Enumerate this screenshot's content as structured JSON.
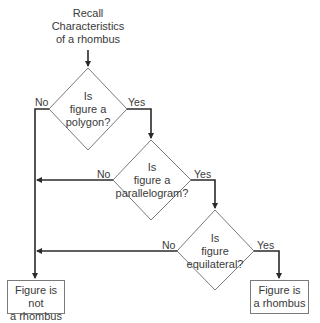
{
  "start": {
    "lines": [
      "Recall",
      "Characteristics",
      "of a rhombus"
    ]
  },
  "decisions": [
    {
      "lines": [
        "Is",
        "figure a",
        "polygon?"
      ],
      "no": "No",
      "yes": "Yes"
    },
    {
      "lines": [
        "Is",
        "figure a",
        "parallelogram?"
      ],
      "no": "No",
      "yes": "Yes"
    },
    {
      "lines": [
        "Is",
        "figure",
        "equilateral?"
      ],
      "no": "No",
      "yes": "Yes"
    }
  ],
  "outcomes": {
    "not_rhombus": {
      "lines": [
        "Figure is not",
        "a rhombus"
      ]
    },
    "rhombus": {
      "lines": [
        "Figure is",
        "a rhombus"
      ]
    }
  },
  "colors": {
    "line": "#3a3a3a",
    "shape_stroke": "#7a7a7a"
  }
}
